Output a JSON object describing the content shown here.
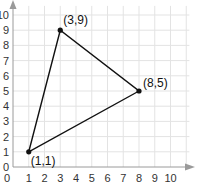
{
  "chart_data": {
    "type": "scatter",
    "title": "",
    "xlabel": "",
    "ylabel": "",
    "xlim": [
      0,
      10
    ],
    "ylim": [
      0,
      10
    ],
    "grid": true,
    "x_ticks": [
      "0",
      "1",
      "2",
      "3",
      "4",
      "5",
      "6",
      "7",
      "8",
      "9",
      "10"
    ],
    "y_ticks": [
      "0",
      "1",
      "2",
      "3",
      "4",
      "5",
      "6",
      "7",
      "8",
      "9",
      "10"
    ],
    "series": [
      {
        "name": "triangle",
        "closed_polygon": true,
        "points": [
          {
            "x": 1,
            "y": 1,
            "label": "(1,1)"
          },
          {
            "x": 3,
            "y": 9,
            "label": "(3,9)"
          },
          {
            "x": 8,
            "y": 5,
            "label": "(8,5)"
          }
        ]
      }
    ],
    "colors": {
      "grid": "#e3e3e3",
      "axis": "#999999",
      "polygon": "#111111"
    }
  }
}
